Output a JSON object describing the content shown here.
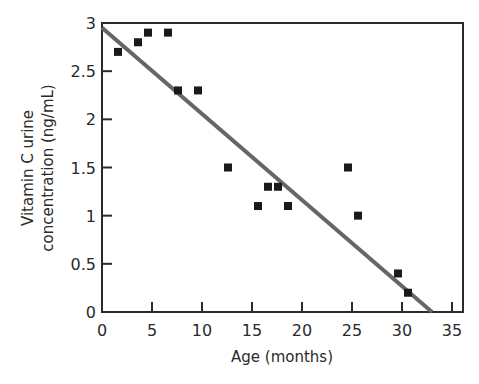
{
  "chart_data": {
    "type": "scatter",
    "title": "",
    "xlabel": "Age (months)",
    "ylabel_lines": [
      "Vitamin C urine",
      "concentration (ng/mL)"
    ],
    "ylabel": "Vitamin C urine concentration (ng/mL)",
    "xlim": [
      0,
      36
    ],
    "ylim": [
      0,
      3
    ],
    "xticks": [
      0,
      5,
      10,
      15,
      20,
      25,
      30,
      35
    ],
    "xtick_labels": [
      "0",
      "5",
      "10",
      "15",
      "20",
      "25",
      "30",
      "35"
    ],
    "yticks": [
      0,
      0.5,
      1,
      1.5,
      2,
      2.5,
      3
    ],
    "ytick_labels": [
      "0",
      "0.5",
      "1",
      "1.5",
      "2",
      "2.5",
      "3"
    ],
    "grid": false,
    "legend": null,
    "points": [
      {
        "x": 1,
        "y": 2.7
      },
      {
        "x": 3,
        "y": 2.8
      },
      {
        "x": 4,
        "y": 2.9
      },
      {
        "x": 6,
        "y": 2.9
      },
      {
        "x": 7,
        "y": 2.3
      },
      {
        "x": 9,
        "y": 2.3
      },
      {
        "x": 12,
        "y": 1.5
      },
      {
        "x": 15,
        "y": 1.1
      },
      {
        "x": 16,
        "y": 1.3
      },
      {
        "x": 17,
        "y": 1.3
      },
      {
        "x": 18,
        "y": 1.1
      },
      {
        "x": 24,
        "y": 1.5
      },
      {
        "x": 25,
        "y": 1.0
      },
      {
        "x": 29,
        "y": 0.4
      },
      {
        "x": 30,
        "y": 0.2
      }
    ],
    "trend_line": {
      "x0": 0,
      "y0": 2.95,
      "x1": 33,
      "y1": 0,
      "color": "#666666"
    },
    "marker_color": "#1a1a1a"
  }
}
